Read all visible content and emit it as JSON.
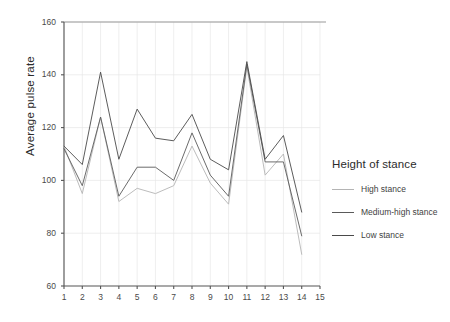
{
  "chart_data": {
    "type": "line",
    "title": "",
    "xlabel": "",
    "ylabel": "Average pulse rate",
    "xlim": [
      1,
      15
    ],
    "ylim": [
      60,
      160
    ],
    "ytick_values": [
      60,
      80,
      100,
      120,
      140,
      160
    ],
    "xtick_values": [
      1,
      2,
      3,
      4,
      5,
      6,
      7,
      8,
      9,
      10,
      11,
      12,
      13,
      14,
      15
    ],
    "grid": true,
    "legend_position": "right",
    "legend_title": "Height of stance",
    "x": [
      1,
      2,
      3,
      4,
      5,
      6,
      7,
      8,
      9,
      10,
      11,
      12,
      13,
      14
    ],
    "series": [
      {
        "name": "High stance",
        "color": "#b4b4b4",
        "values": [
          113,
          95,
          124,
          92,
          97,
          95,
          98,
          113,
          99,
          91,
          143,
          102,
          110,
          72
        ]
      },
      {
        "name": "Medium-high stance",
        "color": "#5a5a5a",
        "values": [
          112,
          98,
          124,
          94,
          105,
          105,
          100,
          118,
          102,
          94,
          144,
          107,
          107,
          79
        ]
      },
      {
        "name": "Low stance",
        "color": "#4a4a4a",
        "values": [
          113,
          106,
          141,
          108,
          127,
          116,
          115,
          125,
          108,
          104,
          145,
          108,
          117,
          88
        ]
      }
    ]
  },
  "axis": {
    "y_title": "Average pulse rate",
    "y_ticks": [
      "60",
      "80",
      "100",
      "120",
      "140",
      "160"
    ],
    "x_ticks": [
      "1",
      "2",
      "3",
      "4",
      "5",
      "6",
      "7",
      "8",
      "9",
      "10",
      "11",
      "12",
      "13",
      "14",
      "15"
    ]
  },
  "legend": {
    "title": "Height of stance",
    "items": [
      {
        "label": "High stance",
        "color": "#b4b4b4"
      },
      {
        "label": "Medium-high stance",
        "color": "#5a5a5a"
      },
      {
        "label": "Low stance",
        "color": "#4a4a4a"
      }
    ]
  },
  "colors": {
    "grid": "#e6e6e6",
    "axis": "#555555",
    "top_border": "#9a9a9a",
    "text": "#3a3a3a"
  }
}
